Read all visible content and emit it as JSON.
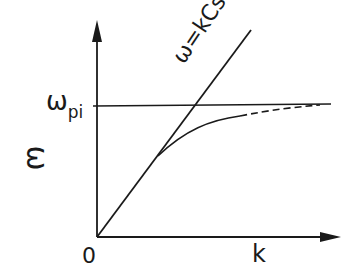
{
  "diagram": {
    "type": "dispersion-relation",
    "axes": {
      "x_label": "k",
      "y_label": "ω",
      "origin_label": "0"
    },
    "labels": {
      "asymptote_main": "ω",
      "asymptote_sub": "pi",
      "line_equation": "ω=kCs"
    },
    "colors": {
      "ink": "#1a1a1a",
      "background": "#ffffff"
    }
  }
}
